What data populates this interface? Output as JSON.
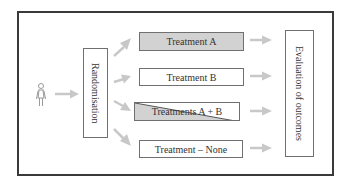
{
  "diagram": {
    "type": "randomised-trial-flow",
    "participant_icon": "person-icon",
    "randomisation": {
      "label": "Randomisation"
    },
    "treatments": [
      {
        "label": "Treatment A",
        "fill": "#d2d2d2",
        "style": "gray"
      },
      {
        "label": "Treatment B",
        "fill": "#ffffff",
        "style": "white"
      },
      {
        "label": "Treatments A + B",
        "fill": "#d2d2d2",
        "style": "diagonal-split"
      },
      {
        "label": "Treatment – None",
        "fill": "#ffffff",
        "style": "white"
      }
    ],
    "evaluation": {
      "label": "Evaluation of outcomes"
    },
    "colors": {
      "frame": "#3a3a3a",
      "box_border": "#707070",
      "arrow": "#c8c8c8",
      "gray_fill": "#d2d2d2",
      "text": "#333333"
    }
  }
}
